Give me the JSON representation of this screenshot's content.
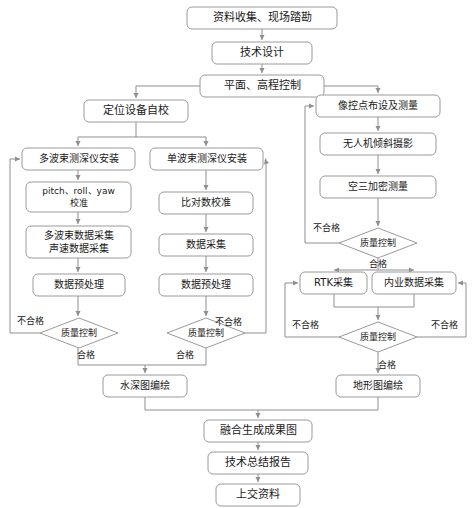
{
  "diagram": {
    "type": "flowchart",
    "orientation": "top-to-bottom",
    "colors": {
      "background": "#ffffff",
      "node_fill": "#ffffff",
      "node_stroke": "#9a9a9a",
      "edge_stroke": "#8f8f8f",
      "text": "#1a1a1a"
    },
    "nodes": [
      {
        "id": "n1",
        "label": "资料收集、现场踏勘",
        "shape": "rounded-rect",
        "x": 187,
        "y": 7,
        "w": 150,
        "h": 22,
        "font": 11
      },
      {
        "id": "n2",
        "label": "技术设计",
        "shape": "rounded-rect",
        "x": 212,
        "y": 42,
        "w": 100,
        "h": 22,
        "font": 11
      },
      {
        "id": "n3",
        "label": "平面、高程控制",
        "shape": "rounded-rect",
        "x": 200,
        "y": 75,
        "w": 124,
        "h": 22,
        "font": 11
      },
      {
        "id": "l1",
        "label": "定位设备自校",
        "shape": "rounded-rect",
        "x": 84,
        "y": 100,
        "w": 104,
        "h": 22,
        "font": 11
      },
      {
        "id": "l2",
        "label": "多波束测深仪安装",
        "shape": "rounded-rect",
        "x": 22,
        "y": 148,
        "w": 113,
        "h": 22,
        "font": 10
      },
      {
        "id": "l3",
        "label": "pitch、roll、yaw\n校准",
        "shape": "rounded-rect",
        "x": 26,
        "y": 182,
        "w": 105,
        "h": 30,
        "font": 9
      },
      {
        "id": "l4",
        "label": "多波束数据采集\n声速数据采集",
        "shape": "rounded-rect",
        "x": 26,
        "y": 226,
        "w": 105,
        "h": 32,
        "font": 10
      },
      {
        "id": "l5",
        "label": "数据预处理",
        "shape": "rounded-rect",
        "x": 33,
        "y": 274,
        "w": 92,
        "h": 22,
        "font": 10
      },
      {
        "id": "l6",
        "label": "质量控制",
        "shape": "diamond",
        "x": 40,
        "y": 318,
        "w": 78,
        "h": 30,
        "font": 9
      },
      {
        "id": "m1",
        "label": "单波束测深仪安装",
        "shape": "rounded-rect",
        "x": 150,
        "y": 148,
        "w": 113,
        "h": 22,
        "font": 10
      },
      {
        "id": "m2",
        "label": "比对数校准",
        "shape": "rounded-rect",
        "x": 159,
        "y": 192,
        "w": 94,
        "h": 22,
        "font": 10
      },
      {
        "id": "m3",
        "label": "数据采集",
        "shape": "rounded-rect",
        "x": 159,
        "y": 234,
        "w": 94,
        "h": 22,
        "font": 10
      },
      {
        "id": "m4",
        "label": "数据预处理",
        "shape": "rounded-rect",
        "x": 159,
        "y": 274,
        "w": 94,
        "h": 22,
        "font": 10
      },
      {
        "id": "m5",
        "label": "质量控制",
        "shape": "diamond",
        "x": 167,
        "y": 318,
        "w": 78,
        "h": 30,
        "font": 9
      },
      {
        "id": "r1",
        "label": "像控点布设及测量",
        "shape": "rounded-rect",
        "x": 316,
        "y": 95,
        "w": 124,
        "h": 22,
        "font": 10
      },
      {
        "id": "r2",
        "label": "无人机倾斜摄影",
        "shape": "rounded-rect",
        "x": 320,
        "y": 133,
        "w": 116,
        "h": 22,
        "font": 10
      },
      {
        "id": "r3",
        "label": "空三加密测量",
        "shape": "rounded-rect",
        "x": 320,
        "y": 176,
        "w": 116,
        "h": 22,
        "font": 10
      },
      {
        "id": "r4",
        "label": "质量控制",
        "shape": "diamond",
        "x": 339,
        "y": 228,
        "w": 78,
        "h": 30,
        "font": 9
      },
      {
        "id": "r5",
        "label": "RTK采集",
        "shape": "rounded-rect",
        "x": 300,
        "y": 272,
        "w": 67,
        "h": 22,
        "font": 10
      },
      {
        "id": "r6",
        "label": "内业数据采集",
        "shape": "rounded-rect",
        "x": 372,
        "y": 272,
        "w": 84,
        "h": 22,
        "font": 10
      },
      {
        "id": "r7",
        "label": "质量控制",
        "shape": "diamond",
        "x": 339,
        "y": 322,
        "w": 78,
        "h": 30,
        "font": 9
      },
      {
        "id": "r8",
        "label": "地形图编绘",
        "shape": "rounded-rect",
        "x": 336,
        "y": 375,
        "w": 84,
        "h": 22,
        "font": 10
      },
      {
        "id": "b1",
        "label": "水深图编绘",
        "shape": "rounded-rect",
        "x": 103,
        "y": 375,
        "w": 84,
        "h": 22,
        "font": 10
      },
      {
        "id": "b2",
        "label": "融合生成成果图",
        "shape": "rounded-rect",
        "x": 204,
        "y": 420,
        "w": 108,
        "h": 22,
        "font": 11
      },
      {
        "id": "b3",
        "label": "技术总结报告",
        "shape": "rounded-rect",
        "x": 208,
        "y": 452,
        "w": 100,
        "h": 22,
        "font": 11
      },
      {
        "id": "b4",
        "label": "上交资料",
        "shape": "rounded-rect",
        "x": 216,
        "y": 484,
        "w": 84,
        "h": 22,
        "font": 11
      }
    ],
    "edge_labels": [
      {
        "id": "el1",
        "text": "不合格",
        "x": 30,
        "y": 321
      },
      {
        "id": "el2",
        "text": "合格",
        "x": 86,
        "y": 355
      },
      {
        "id": "el3",
        "text": "不合格",
        "x": 228,
        "y": 322
      },
      {
        "id": "el4",
        "text": "合格",
        "x": 185,
        "y": 355
      },
      {
        "id": "el5",
        "text": "不合格",
        "x": 326,
        "y": 228
      },
      {
        "id": "el6",
        "text": "合格",
        "x": 378,
        "y": 264
      },
      {
        "id": "el7",
        "text": "不合格",
        "x": 305,
        "y": 325
      },
      {
        "id": "el8",
        "text": "不合格",
        "x": 444,
        "y": 325
      },
      {
        "id": "el9",
        "text": "合格",
        "x": 387,
        "y": 365
      }
    ],
    "edges": [
      {
        "id": "e1",
        "from": "n1",
        "to": "n2",
        "path": "M262,29 L262,40",
        "arrow": "down"
      },
      {
        "id": "e2",
        "from": "n2",
        "to": "n3",
        "path": "M262,64 L262,73",
        "arrow": "down"
      },
      {
        "id": "e3",
        "from": "n3",
        "to": "l1",
        "path": "M200,86 L136,86 L136,98",
        "arrow": "down"
      },
      {
        "id": "e4",
        "from": "n3",
        "to": "r1",
        "path": "M324,86 L378,86 L378,93",
        "arrow": "down"
      },
      {
        "id": "e5",
        "from": "l1",
        "to": "l2",
        "path": "M136,122 L136,137 L78,137 L78,146",
        "arrow": "down"
      },
      {
        "id": "e6",
        "from": "l1",
        "to": "m1",
        "path": "M136,137 L206,137 L206,146",
        "arrow": "down"
      },
      {
        "id": "e7",
        "from": "l2",
        "to": "l3",
        "path": "M78,170 L78,180",
        "arrow": "down"
      },
      {
        "id": "e8",
        "from": "l3",
        "to": "l4",
        "path": "M78,212 L78,224",
        "arrow": "down"
      },
      {
        "id": "e9",
        "from": "l4",
        "to": "l5",
        "path": "M78,258 L78,272",
        "arrow": "down"
      },
      {
        "id": "e10",
        "from": "l5",
        "to": "l6",
        "path": "M78,296 L78,316",
        "arrow": "down"
      },
      {
        "id": "e11",
        "from": "l6",
        "to": "l2",
        "path": "M40,333 L10,333 L10,159 L20,159",
        "arrow": "right"
      },
      {
        "id": "e12",
        "from": "l6",
        "to": "b1",
        "path": "M78,348 L78,365 L145,365 L145,373",
        "arrow": "down"
      },
      {
        "id": "e13",
        "from": "m1",
        "to": "m2",
        "path": "M206,170 L206,190",
        "arrow": "down"
      },
      {
        "id": "e14",
        "from": "m2",
        "to": "m3",
        "path": "M206,214 L206,232",
        "arrow": "down"
      },
      {
        "id": "e15",
        "from": "m3",
        "to": "m4",
        "path": "M206,256 L206,272",
        "arrow": "down"
      },
      {
        "id": "e16",
        "from": "m4",
        "to": "m5",
        "path": "M206,296 L206,316",
        "arrow": "down"
      },
      {
        "id": "e17",
        "from": "m5",
        "to": "m1",
        "path": "M245,333 L266,333 L266,159 L265,159",
        "arrow": "right"
      },
      {
        "id": "e18",
        "from": "m5",
        "to": "b1",
        "path": "M206,348 L206,365 L145,365",
        "arrow": "none"
      },
      {
        "id": "e19",
        "from": "r1",
        "to": "r2",
        "path": "M378,117 L378,131",
        "arrow": "down"
      },
      {
        "id": "e20",
        "from": "r2",
        "to": "r3",
        "path": "M378,155 L378,174",
        "arrow": "down"
      },
      {
        "id": "e21",
        "from": "r3",
        "to": "r4",
        "path": "M378,198 L378,226",
        "arrow": "down"
      },
      {
        "id": "e22",
        "from": "r4",
        "to": "r1",
        "path": "M339,243 L305,243 L305,106 L314,106",
        "arrow": "right"
      },
      {
        "id": "e23",
        "from": "r4",
        "to": "r5",
        "path": "M378,258 L378,270 L334,270 L334,270",
        "arrow": "down"
      },
      {
        "id": "e24",
        "from": "r4",
        "to": "r6",
        "path": "M378,270 L414,270 L414,270",
        "arrow": "down"
      },
      {
        "id": "e25",
        "from": "r5",
        "to": "r7",
        "path": "M334,294 L334,307 L378,307 L378,320",
        "arrow": "down"
      },
      {
        "id": "e26",
        "from": "r6",
        "to": "r7",
        "path": "M414,294 L414,307 L378,307",
        "arrow": "none"
      },
      {
        "id": "e27",
        "from": "r7",
        "to": "r5",
        "path": "M339,337 L285,337 L285,283 L298,283",
        "arrow": "right"
      },
      {
        "id": "e28",
        "from": "r7",
        "to": "r6",
        "path": "M417,337 L466,337 L466,283 L458,283",
        "arrow": "left"
      },
      {
        "id": "e29",
        "from": "r7",
        "to": "r8",
        "path": "M378,352 L378,373",
        "arrow": "down"
      },
      {
        "id": "e30",
        "from": "b1",
        "to": "b2",
        "path": "M145,397 L145,410 L258,410 L258,418",
        "arrow": "down"
      },
      {
        "id": "e31",
        "from": "r8",
        "to": "b2",
        "path": "M378,397 L378,410 L258,410",
        "arrow": "none"
      },
      {
        "id": "e32",
        "from": "b2",
        "to": "b3",
        "path": "M258,442 L258,450",
        "arrow": "down"
      },
      {
        "id": "e33",
        "from": "b3",
        "to": "b4",
        "path": "M258,474 L258,482",
        "arrow": "down"
      }
    ]
  }
}
